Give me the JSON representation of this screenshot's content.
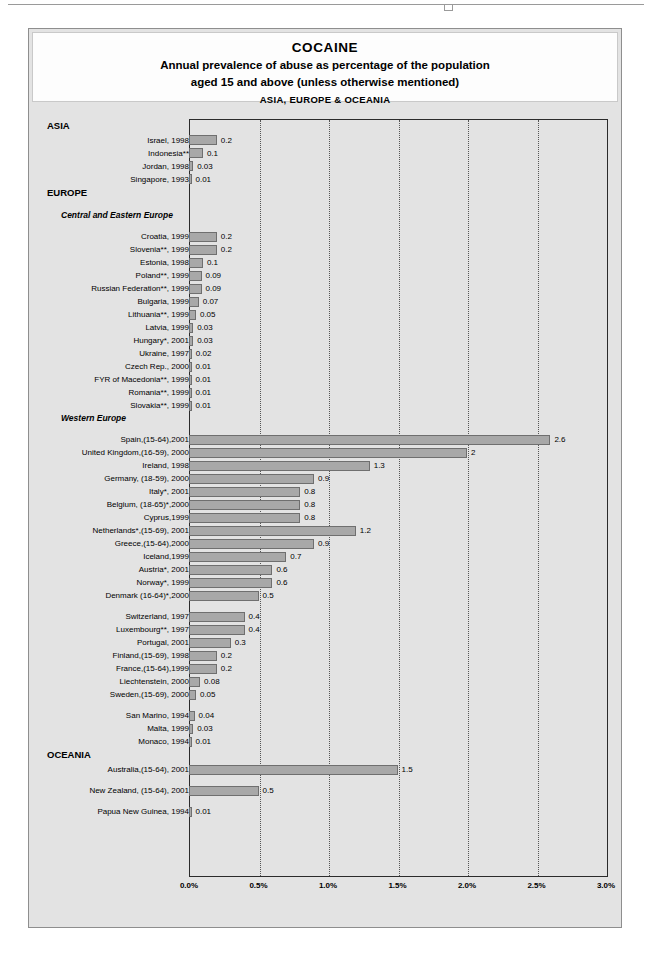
{
  "title": {
    "main": "COCAINE",
    "sub_line1": "Annual prevalence of abuse as percentage of the population",
    "sub_line2": "aged 15 and above (unless otherwise mentioned)",
    "region": "ASIA, EUROPE & OCEANIA"
  },
  "colors": {
    "bar_fill": "#a8a8a8",
    "bar_border": "#6f6f6f",
    "plot_background": "#e3e3e3",
    "axis": "#2b2b2b",
    "gridline": "#555555"
  },
  "chart_data": {
    "type": "bar",
    "orientation": "horizontal",
    "xlabel": "",
    "ylabel": "",
    "xlim": [
      0,
      3.0
    ],
    "xticks": [
      "0.0%",
      "0.5%",
      "1.0%",
      "1.5%",
      "2.0%",
      "2.5%",
      "3.0%"
    ],
    "xtick_values": [
      0,
      0.5,
      1.0,
      1.5,
      2.0,
      2.5,
      3.0
    ],
    "grid": true,
    "legend": "none",
    "units": "percent",
    "rows": [
      {
        "kind": "section",
        "label": "ASIA"
      },
      {
        "kind": "bar",
        "label": "Israel, 1998",
        "value": 0.2,
        "display": "0.2"
      },
      {
        "kind": "bar",
        "label": "Indonesia**",
        "value": 0.1,
        "display": "0.1"
      },
      {
        "kind": "bar",
        "label": "Jordan, 1998",
        "value": 0.03,
        "display": "0.03"
      },
      {
        "kind": "bar",
        "label": "Singapore, 1993",
        "value": 0.01,
        "display": "0.01"
      },
      {
        "kind": "section",
        "label": "EUROPE"
      },
      {
        "kind": "spacer"
      },
      {
        "kind": "subsection",
        "label": "Central and Eastern Europe"
      },
      {
        "kind": "spacer"
      },
      {
        "kind": "bar",
        "label": "Croatia, 1999",
        "value": 0.2,
        "display": "0.2"
      },
      {
        "kind": "bar",
        "label": "Slovenia**, 1999",
        "value": 0.2,
        "display": "0.2"
      },
      {
        "kind": "bar",
        "label": "Estonia, 1998",
        "value": 0.1,
        "display": "0.1"
      },
      {
        "kind": "bar",
        "label": "Poland**, 1999",
        "value": 0.09,
        "display": "0.09"
      },
      {
        "kind": "bar",
        "label": "Russian Federation**, 1999",
        "value": 0.09,
        "display": "0.09"
      },
      {
        "kind": "bar",
        "label": "Bulgaria, 1999",
        "value": 0.07,
        "display": "0.07"
      },
      {
        "kind": "bar",
        "label": "Lithuania**, 1999",
        "value": 0.05,
        "display": "0.05"
      },
      {
        "kind": "bar",
        "label": "Latvia, 1999",
        "value": 0.03,
        "display": "0.03"
      },
      {
        "kind": "bar",
        "label": "Hungary*, 2001",
        "value": 0.03,
        "display": "0.03"
      },
      {
        "kind": "bar",
        "label": "Ukraine, 1997",
        "value": 0.02,
        "display": "0.02"
      },
      {
        "kind": "bar",
        "label": "Czech Rep., 2000",
        "value": 0.01,
        "display": "0.01"
      },
      {
        "kind": "bar",
        "label": "FYR of Macedonia**, 1999",
        "value": 0.01,
        "display": "0.01"
      },
      {
        "kind": "bar",
        "label": "Romania**, 1999",
        "value": 0.01,
        "display": "0.01"
      },
      {
        "kind": "bar",
        "label": "Slovakia**, 1999",
        "value": 0.01,
        "display": "0.01"
      },
      {
        "kind": "subsection",
        "label": "Western Europe"
      },
      {
        "kind": "spacer"
      },
      {
        "kind": "bar",
        "label": "Spain,(15-64),2001",
        "value": 2.6,
        "display": "2.6"
      },
      {
        "kind": "bar",
        "label": "United Kingdom,(16-59), 2000",
        "value": 2.0,
        "display": "2"
      },
      {
        "kind": "bar",
        "label": "Ireland, 1998",
        "value": 1.3,
        "display": "1.3"
      },
      {
        "kind": "bar",
        "label": "Germany, (18-59), 2000",
        "value": 0.9,
        "display": "0.9"
      },
      {
        "kind": "bar",
        "label": "Italy*, 2001",
        "value": 0.8,
        "display": "0.8"
      },
      {
        "kind": "bar",
        "label": "Belgium, (18-65)*,2000",
        "value": 0.8,
        "display": "0.8"
      },
      {
        "kind": "bar",
        "label": "Cyprus,1999",
        "value": 0.8,
        "display": "0.8"
      },
      {
        "kind": "bar",
        "label": "Netherlands*,(15-69), 2001",
        "value": 1.2,
        "display": "1.2"
      },
      {
        "kind": "bar",
        "label": "Greece,(15-64),2000",
        "value": 0.9,
        "display": "0.9"
      },
      {
        "kind": "bar",
        "label": "Iceland,1999",
        "value": 0.7,
        "display": "0.7"
      },
      {
        "kind": "bar",
        "label": "Austria*, 2001",
        "value": 0.6,
        "display": "0.6"
      },
      {
        "kind": "bar",
        "label": "Norway*, 1999",
        "value": 0.6,
        "display": "0.6"
      },
      {
        "kind": "bar",
        "label": "Denmark (16-64)*,2000",
        "value": 0.5,
        "display": "0.5"
      },
      {
        "kind": "spacer"
      },
      {
        "kind": "bar",
        "label": "Switzerland, 1997",
        "value": 0.4,
        "display": "0.4"
      },
      {
        "kind": "bar",
        "label": "Luxembourg**, 1997",
        "value": 0.4,
        "display": "0.4"
      },
      {
        "kind": "bar",
        "label": "Portugal, 2001",
        "value": 0.3,
        "display": "0.3"
      },
      {
        "kind": "bar",
        "label": "Finland,(15-69), 1998",
        "value": 0.2,
        "display": "0.2"
      },
      {
        "kind": "bar",
        "label": "France,(15-64),1999",
        "value": 0.2,
        "display": "0.2"
      },
      {
        "kind": "bar",
        "label": "Liechtenstein, 2000",
        "value": 0.08,
        "display": "0.08"
      },
      {
        "kind": "bar",
        "label": "Sweden,(15-69), 2000",
        "value": 0.05,
        "display": "0.05"
      },
      {
        "kind": "spacer"
      },
      {
        "kind": "bar",
        "label": "San Marino, 1994",
        "value": 0.04,
        "display": "0.04"
      },
      {
        "kind": "bar",
        "label": "Malta, 1999",
        "value": 0.03,
        "display": "0.03"
      },
      {
        "kind": "bar",
        "label": "Monaco, 1994",
        "value": 0.01,
        "display": "0.01"
      },
      {
        "kind": "section",
        "label": "OCEANIA"
      },
      {
        "kind": "bar",
        "label": "Australia,(15-64), 2001",
        "value": 1.5,
        "display": "1.5"
      },
      {
        "kind": "spacer"
      },
      {
        "kind": "bar",
        "label": "New Zealand, (15-64), 2001",
        "value": 0.5,
        "display": "0.5"
      },
      {
        "kind": "spacer"
      },
      {
        "kind": "bar",
        "label": "Papua New Guinea, 1994",
        "value": 0.01,
        "display": "0.01"
      }
    ]
  }
}
